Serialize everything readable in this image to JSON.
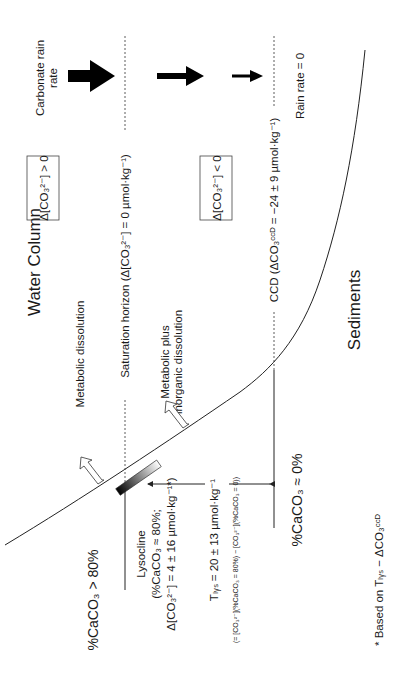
{
  "diagram": {
    "title_water_column": "Water Column",
    "title_sediments": "Sediments",
    "rain": {
      "label_line1": "Carbonate rain",
      "label_line2": "rate",
      "zero_label": "Rain rate = 0",
      "arrows": [
        "large-arrow",
        "medium-arrow",
        "small-arrow"
      ]
    },
    "saturation_horizon": {
      "label": "Saturation horizon (Δ[CO₃²⁻] = 0 µmol·kg⁻¹)"
    },
    "ccd": {
      "label": "CCD (ΔCO₃ᶜᶜᴰ = −24 ± 9 µmol·kg⁻¹)"
    },
    "boxes": {
      "above": "Δ[CO₃²⁻] > 0",
      "below": "Δ[CO₃²⁻] < 0"
    },
    "dissolution": {
      "metabolic": "Metabolic dissolution",
      "metabolic_plus_line1": "Metabolic plus",
      "metabolic_plus_line2": "inorganic dissolution"
    },
    "lysocline": {
      "line1": "Lysocline",
      "line2": "(%CaCO₃ ≈ 80%;",
      "line3": "Δ[CO₃²⁻] = 4 ± 16 µmol·kg⁻¹*)"
    },
    "tlys": {
      "line1": "Tₗᵧₛ = 20 ± 13 µmol·kg⁻¹",
      "line2": "(= [CO₃²⁻](%CaCO₃ = 80%) − [CO₃²⁻](%CaCO₃ = 0))"
    },
    "caco3_high": "%CaCO₃ > 80%",
    "caco3_zero": "%CaCO₃ ≈ 0%",
    "footnote": "* Based on Tₗᵧₛ − ΔCO₃ᶜᶜᴰ"
  }
}
